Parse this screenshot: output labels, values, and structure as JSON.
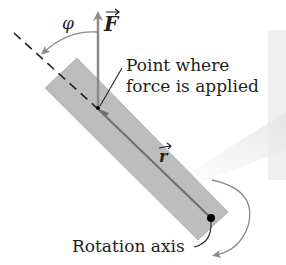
{
  "diagram": {
    "labels": {
      "force": "F",
      "angle": "φ",
      "point_line1": "Point where",
      "point_line2": "force is applied",
      "radius": "r",
      "rotation_axis": "Rotation axis"
    },
    "colors": {
      "bar_fill": "#bdbdbd",
      "bar_stroke": "#a5a5a5",
      "arrow": "#8a8a8a",
      "text": "#231f20",
      "axis_dot": "#000000",
      "highlight": "#eeeeee"
    }
  }
}
